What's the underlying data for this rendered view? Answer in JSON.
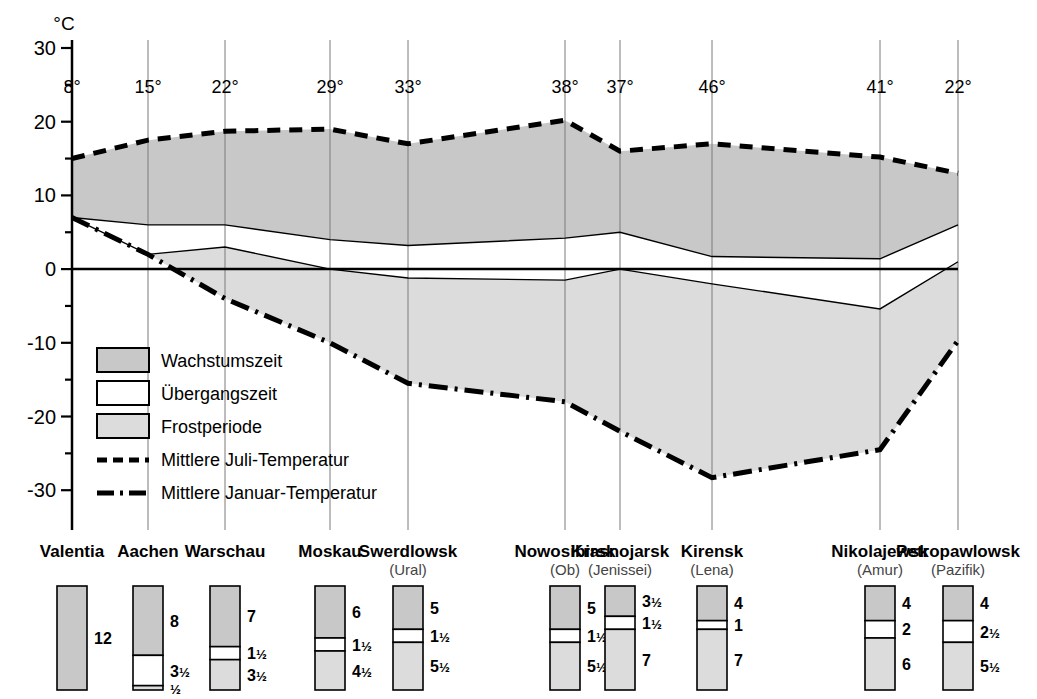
{
  "chart_data": {
    "type": "area",
    "title": "",
    "ylabel": "°C",
    "ylim": [
      -34,
      32
    ],
    "yticks": [
      "30",
      "20",
      "10",
      "0",
      "-10",
      "-20",
      "-30"
    ],
    "ytick_values": [
      30,
      20,
      10,
      0,
      -10,
      -20,
      -30
    ],
    "yminor_values": [
      25,
      15,
      5,
      -5,
      -15,
      -25
    ],
    "grid": true,
    "legend_position": "inside-lower-left",
    "xlabel": "",
    "categories": [
      "Valentia",
      "Aachen",
      "Warschau",
      "Moskau",
      "Swerdlowsk",
      "Nowosibirsk",
      "Krasnojarsk",
      "Kirensk",
      "Nikolajewsk",
      "Petropawlowsk"
    ],
    "tick_labels": [
      "8°",
      "15°",
      "22°",
      "29°",
      "33°",
      "38°",
      "37°",
      "46°",
      "41°",
      "22°"
    ],
    "tick_label_caption": "Jahresschwankung der Temperatur",
    "series": [
      {
        "name": "Mittlere Juli-Temperatur",
        "style": "dashed",
        "values": [
          15,
          17.5,
          18.7,
          19,
          17,
          20.2,
          16,
          17,
          15.2,
          13
        ]
      },
      {
        "name": "Mittlere Januar-Temperatur",
        "style": "dash-dot",
        "values": [
          7,
          2,
          -4,
          -10,
          -15.5,
          -18,
          -22,
          -28.3,
          -24.5,
          -9.7
        ]
      },
      {
        "name": "Wachstumszeit-Untergrenze",
        "style": "solid-thin",
        "values": [
          7,
          6,
          6,
          4,
          3.2,
          4.2,
          5,
          1.7,
          1.4,
          6
        ]
      },
      {
        "name": "Uebergangszeit-Untergrenze",
        "style": "solid-thin",
        "values": [
          7,
          2,
          3,
          0,
          -1.2,
          -1.5,
          0,
          -2,
          -5.4,
          1
        ]
      }
    ],
    "bands": [
      {
        "name": "Wachstumszeit",
        "fill": "#c8c8c8"
      },
      {
        "name": "Übergangszeit",
        "fill": "#ffffff"
      },
      {
        "name": "Frostperiode",
        "fill": "#dcdcdc"
      }
    ]
  },
  "legend": {
    "items": [
      {
        "label": "Wachstumszeit",
        "type": "swatch",
        "fill": "#c8c8c8"
      },
      {
        "label": "Übergangszeit",
        "type": "swatch",
        "fill": "#ffffff"
      },
      {
        "label": "Frostperiode",
        "type": "swatch",
        "fill": "#dcdcdc"
      },
      {
        "label": "Mittlere Juli-Temperatur",
        "type": "dashed-line"
      },
      {
        "label": "Mittlere Januar-Temperatur",
        "type": "dashdot-line"
      }
    ]
  },
  "stations": [
    {
      "name": "Valentia",
      "river": "",
      "segments": [
        {
          "phase": "Wachstumszeit",
          "label": "12",
          "months": 12,
          "fill": "#c8c8c8"
        }
      ]
    },
    {
      "name": "Aachen",
      "river": "",
      "segments": [
        {
          "phase": "Wachstumszeit",
          "label": "8",
          "months": 8,
          "fill": "#c8c8c8"
        },
        {
          "phase": "Übergangszeit",
          "label": "3½",
          "months": 3.5,
          "fill": "#ffffff"
        },
        {
          "phase": "Frostperiode",
          "label": "½",
          "months": 0.5,
          "fill": "#dcdcdc"
        }
      ]
    },
    {
      "name": "Warschau",
      "river": "",
      "segments": [
        {
          "phase": "Wachstumszeit",
          "label": "7",
          "months": 7,
          "fill": "#c8c8c8"
        },
        {
          "phase": "Übergangszeit",
          "label": "1½",
          "months": 1.5,
          "fill": "#ffffff"
        },
        {
          "phase": "Frostperiode",
          "label": "3½",
          "months": 3.5,
          "fill": "#dcdcdc"
        }
      ]
    },
    {
      "name": "Moskau",
      "river": "",
      "segments": [
        {
          "phase": "Wachstumszeit",
          "label": "6",
          "months": 6,
          "fill": "#c8c8c8"
        },
        {
          "phase": "Übergangszeit",
          "label": "1½",
          "months": 1.5,
          "fill": "#ffffff"
        },
        {
          "phase": "Frostperiode",
          "label": "4½",
          "months": 4.5,
          "fill": "#dcdcdc"
        }
      ]
    },
    {
      "name": "Swerdlowsk",
      "river": "(Ural)",
      "segments": [
        {
          "phase": "Wachstumszeit",
          "label": "5",
          "months": 5,
          "fill": "#c8c8c8"
        },
        {
          "phase": "Übergangszeit",
          "label": "1½",
          "months": 1.5,
          "fill": "#ffffff"
        },
        {
          "phase": "Frostperiode",
          "label": "5½",
          "months": 5.5,
          "fill": "#dcdcdc"
        }
      ]
    },
    {
      "name": "Nowosibirsk",
      "river": "(Ob)",
      "segments": [
        {
          "phase": "Wachstumszeit",
          "label": "5",
          "months": 5,
          "fill": "#c8c8c8"
        },
        {
          "phase": "Übergangszeit",
          "label": "1½",
          "months": 1.5,
          "fill": "#ffffff"
        },
        {
          "phase": "Frostperiode",
          "label": "5½",
          "months": 5.5,
          "fill": "#dcdcdc"
        }
      ]
    },
    {
      "name": "Krasnojarsk",
      "river": "(Jenissei)",
      "segments": [
        {
          "phase": "Wachstumszeit",
          "label": "3½",
          "months": 3.5,
          "fill": "#c8c8c8"
        },
        {
          "phase": "Übergangszeit",
          "label": "1½",
          "months": 1.5,
          "fill": "#ffffff"
        },
        {
          "phase": "Frostperiode",
          "label": "7",
          "months": 7,
          "fill": "#dcdcdc"
        }
      ]
    },
    {
      "name": "Kirensk",
      "river": "(Lena)",
      "segments": [
        {
          "phase": "Wachstumszeit",
          "label": "4",
          "months": 4,
          "fill": "#c8c8c8"
        },
        {
          "phase": "Übergangszeit",
          "label": "1",
          "months": 1,
          "fill": "#ffffff"
        },
        {
          "phase": "Frostperiode",
          "label": "7",
          "months": 7,
          "fill": "#dcdcdc"
        }
      ]
    },
    {
      "name": "Nikolajewsk",
      "river": "(Amur)",
      "segments": [
        {
          "phase": "Wachstumszeit",
          "label": "4",
          "months": 4,
          "fill": "#c8c8c8"
        },
        {
          "phase": "Übergangszeit",
          "label": "2",
          "months": 2,
          "fill": "#ffffff"
        },
        {
          "phase": "Frostperiode",
          "label": "6",
          "months": 6,
          "fill": "#dcdcdc"
        }
      ]
    },
    {
      "name": "Petropawlowsk",
      "river": "(Pazifik)",
      "segments": [
        {
          "phase": "Wachstumszeit",
          "label": "4",
          "months": 4,
          "fill": "#c8c8c8"
        },
        {
          "phase": "Übergangszeit",
          "label": "2½",
          "months": 2.5,
          "fill": "#ffffff"
        },
        {
          "phase": "Frostperiode",
          "label": "5½",
          "months": 5.5,
          "fill": "#dcdcdc"
        }
      ]
    }
  ],
  "colors": {
    "growth_fill": "#c8c8c8",
    "transition_fill": "#ffffff",
    "frost_fill": "#dcdcdc",
    "line": "#000000",
    "gridline": "#808080"
  }
}
